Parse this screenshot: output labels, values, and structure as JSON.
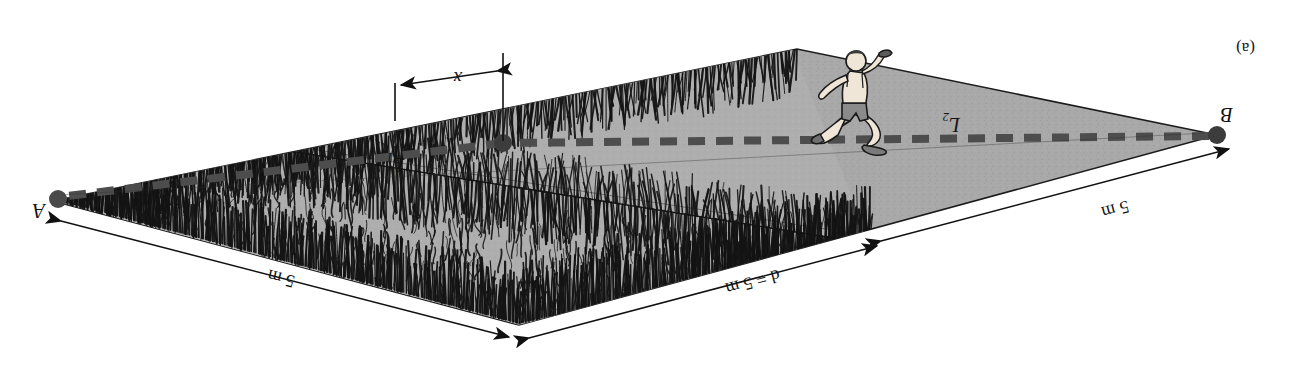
{
  "figure": {
    "panel_label": "(a)",
    "type": "physics-diagram",
    "orientation_note": "printed upside down",
    "labels": {
      "point_a": "A",
      "point_b": "B",
      "path_1": "L",
      "path_1_sub": "1",
      "path_2": "L",
      "path_2_sub": "2",
      "distance_x": "x",
      "side_top_right": "5 m",
      "side_top_left": "d = 5 m",
      "side_left": "5 m"
    },
    "colors": {
      "field_fill": "#a9a9a9",
      "ink": "#111111",
      "dashed_path": "#4d4d4d",
      "point_dot": "#3c3c3c",
      "paper": "#ffffff",
      "skin": "#efe6d8",
      "shirt": "#8b8b8b",
      "shoe": "#7a7a7a"
    },
    "geometry": {
      "note": "values read off the drawing in screenshot pixel coordinates",
      "vertex_b": [
        92,
        236
      ],
      "vertex_a": [
        1256,
        170
      ],
      "vertex_top": [
        790,
        46
      ],
      "vertex_bottom": [
        512,
        322
      ],
      "grass_boundary_left": [
        438,
        127
      ],
      "dot_mid": [
        806,
        228
      ]
    }
  },
  "chart_data": {
    "type": "diagram",
    "title": "(a)",
    "annotations": [
      {
        "text": "A",
        "role": "endpoint-label"
      },
      {
        "text": "B",
        "role": "endpoint-label"
      },
      {
        "text": "L1",
        "role": "path-label"
      },
      {
        "text": "L2",
        "role": "path-label"
      },
      {
        "text": "x",
        "role": "dimension-label"
      },
      {
        "text": "5 m",
        "role": "edge-dimension"
      },
      {
        "text": "d = 5 m",
        "role": "edge-dimension"
      },
      {
        "text": "5 m",
        "role": "edge-dimension"
      }
    ]
  }
}
